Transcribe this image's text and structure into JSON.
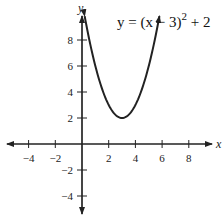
{
  "chart_data": {
    "type": "line",
    "title": "",
    "annotation": "y = (x − 3)² + 2",
    "equation": {
      "base": "y = (x − 3)",
      "exponent": "2",
      "tail": " + 2"
    },
    "xlabel": "x",
    "ylabel": "y",
    "xlim": [
      -5.5,
      10
    ],
    "ylim": [
      -5.3,
      9.5
    ],
    "grid": false,
    "legend": "none",
    "x_ticks": [
      -4,
      -2,
      2,
      4,
      6,
      8
    ],
    "y_ticks": [
      -4,
      -2,
      2,
      4,
      6,
      8
    ],
    "x_tick_labels": [
      "−4",
      "−2",
      "2",
      "4",
      "6",
      "8"
    ],
    "y_tick_labels": [
      "−4",
      "−2",
      "2",
      "4",
      "6",
      "8"
    ],
    "series": [
      {
        "name": "y = (x − 3)^2 + 2",
        "function": "(x-3)^2+2",
        "domain": [
          0.2,
          5.8
        ],
        "vertex": [
          3,
          2
        ],
        "arrows_at_ends": true,
        "x": [
          0.2,
          1,
          2,
          3,
          4,
          5,
          5.8
        ],
        "values": [
          9.84,
          6,
          3,
          2,
          3,
          6,
          9.84
        ]
      }
    ]
  }
}
